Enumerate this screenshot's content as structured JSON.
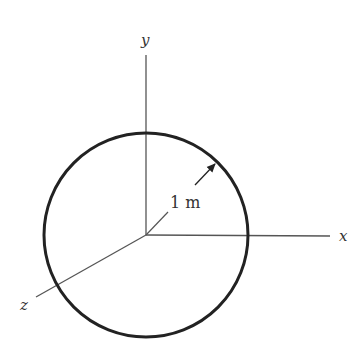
{
  "diagram": {
    "axes": {
      "x_label": "x",
      "y_label": "y",
      "z_label": "z"
    },
    "circle": {
      "radius_label": "1 m",
      "center": [
        146,
        235
      ],
      "radius_px": 102
    },
    "colors": {
      "stroke": "#222222",
      "axis": "#555555",
      "background": "#ffffff"
    }
  }
}
